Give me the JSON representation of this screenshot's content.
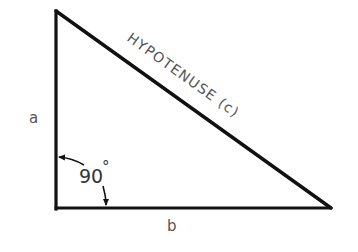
{
  "diagram": {
    "labels": {
      "side_a": "a",
      "side_b": "b",
      "hypotenuse": "HYPOTENUSE (c)",
      "angle": "90",
      "degree_symbol": "°"
    },
    "colors": {
      "stroke": "#111111",
      "text": "#555555",
      "background": "#ffffff"
    },
    "vertices": {
      "top": [
        55,
        11
      ],
      "right_angle": [
        56,
        208
      ],
      "right": [
        331,
        208
      ]
    }
  }
}
